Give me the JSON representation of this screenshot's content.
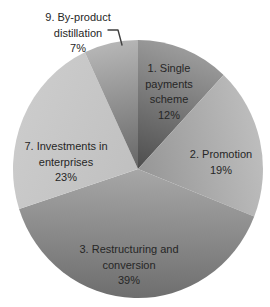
{
  "chart_data": {
    "type": "pie",
    "title": "",
    "direction": "clockwise",
    "start_angle_deg": 0,
    "legend": "none",
    "background_color": "#ffffff",
    "label_text_color": "#262626",
    "slices": [
      {
        "number": "1",
        "name": "1. Single payments scheme",
        "value": 12,
        "percent_label": "12%",
        "label_lines": [
          "1. Single",
          "payments",
          "scheme",
          "12%"
        ],
        "outer_color": "#9b9b9b",
        "inner_color": "#4d4d4d"
      },
      {
        "number": "2",
        "name": "2. Promotion",
        "value": 19,
        "percent_label": "19%",
        "label_lines": [
          "2. Promotion",
          "19%"
        ],
        "outer_color": "#bdbdbd",
        "inner_color": "#969696"
      },
      {
        "number": "3",
        "name": "3. Restructuring and conversion",
        "value": 39,
        "percent_label": "39%",
        "label_lines": [
          "3. Restructuring and",
          "conversion",
          "39%"
        ],
        "outer_color": "#6e6e6e",
        "inner_color": "#a7a7a7"
      },
      {
        "number": "7",
        "name": "7. Investments in enterprises",
        "value": 23,
        "percent_label": "23%",
        "label_lines": [
          "7. Investments in",
          "enterprises",
          "23%"
        ],
        "outer_color": "#cbcbcb",
        "inner_color": "#c0c0c0"
      },
      {
        "number": "9",
        "name": "9. By-product distillation",
        "value": 7,
        "percent_label": "7%",
        "label_lines": [
          "9. By-product",
          "distillation",
          "7%"
        ],
        "outer_color": "#b6b6b6",
        "inner_color": "#666666"
      }
    ]
  }
}
